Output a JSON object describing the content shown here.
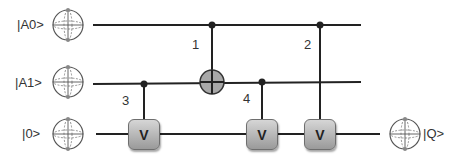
{
  "diagram": {
    "inputs": [
      {
        "label": "|A0>",
        "y": 25
      },
      {
        "label": "|A1>",
        "y": 83
      },
      {
        "label": "|0>",
        "y": 134
      }
    ],
    "output": {
      "label": "|Q>",
      "y": 134
    },
    "gates": [
      {
        "step": "1",
        "type": "CNOT",
        "control": "A0",
        "target": "A1"
      },
      {
        "step": "2",
        "type": "controlled-V",
        "control": "A0",
        "target": "ancilla",
        "label": "V"
      },
      {
        "step": "3",
        "type": "controlled-V",
        "control": "A1",
        "target": "ancilla",
        "label": "V"
      },
      {
        "step": "4",
        "type": "controlled-V",
        "control": "A1",
        "target": "ancilla",
        "label": "V"
      }
    ],
    "colors": {
      "wire": "#222222",
      "gate_fill": "#b0b0b0",
      "cnot_fill": "#a8a8a8"
    }
  }
}
